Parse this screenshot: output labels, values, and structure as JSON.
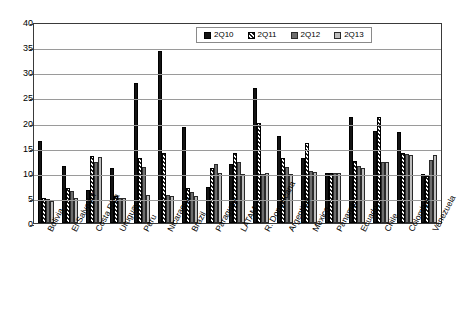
{
  "chart_data": {
    "type": "bar",
    "title": "",
    "xlabel": "",
    "ylabel": "",
    "ylim": [
      0,
      40
    ],
    "yticks": [
      0,
      5,
      10,
      15,
      20,
      25,
      30,
      35,
      40
    ],
    "grid": true,
    "legend_position": "top-center",
    "categories": [
      "Bolivia",
      "El Salvador",
      "Costa Rica",
      "Uruguay",
      "Peru",
      "Nicaragua",
      "Brazil",
      "Paraguay",
      "LATAM",
      "R. Dominicana",
      "Argentina",
      "Mexico",
      "Panamá",
      "Ecuador",
      "Chile",
      "Colombia",
      "Venezuela"
    ],
    "series": [
      {
        "name": "2Q10",
        "color": "#131313",
        "pattern": "solid-black",
        "values": [
          16.3,
          11.4,
          6.6,
          11.0,
          27.8,
          34.3,
          19.2,
          7.2,
          11.8,
          26.9,
          17.4,
          12.9,
          9.9,
          21.0,
          18.4,
          18.2,
          9.8
        ]
      },
      {
        "name": "2Q11",
        "color": "#1c1c1c",
        "pattern": "diagonal-hatch",
        "values": [
          5.0,
          6.9,
          13.4,
          5.4,
          12.9,
          14.0,
          6.9,
          11.0,
          13.9,
          20.0,
          12.9,
          16.0,
          9.9,
          12.4,
          21.0,
          13.9,
          9.4
        ]
      },
      {
        "name": "2Q12",
        "color": "#6d6d6d",
        "pattern": "dark-gray",
        "values": [
          4.8,
          6.4,
          12.2,
          5.0,
          11.1,
          5.6,
          6.2,
          11.7,
          12.2,
          9.7,
          11.2,
          10.4,
          9.9,
          11.3,
          12.2,
          13.8,
          12.6
        ]
      },
      {
        "name": "2Q13",
        "color": "#bdbdbd",
        "pattern": "light-gray",
        "values": [
          4.3,
          4.9,
          13.1,
          5.0,
          5.6,
          5.3,
          5.4,
          9.9,
          9.7,
          9.9,
          9.8,
          10.2,
          9.9,
          11.0,
          12.2,
          13.5,
          13.6
        ]
      }
    ]
  }
}
